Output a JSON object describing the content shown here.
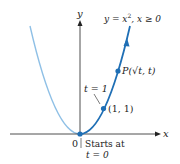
{
  "diagram": {
    "type": "parametric-curve",
    "axes": {
      "x_label": "x",
      "y_label": "y",
      "origin_label": "0"
    },
    "curve_label": "y = x², x ≥ 0",
    "curve_label_parts": {
      "lhs": "y = x",
      "exp": "2",
      "rest": ", x ≥ 0"
    },
    "points": [
      {
        "name": "origin",
        "label": "",
        "note_line1": "Starts at",
        "note_line2": "t = 0"
      },
      {
        "name": "point-1-1",
        "label": "(1, 1)",
        "param_label": "t = 1"
      },
      {
        "name": "point-p",
        "label": "P(√t, t)"
      }
    ],
    "colors": {
      "curve_dark": "#1f6fb5",
      "curve_light": "#8fc0e6",
      "axis": "#222222"
    }
  }
}
